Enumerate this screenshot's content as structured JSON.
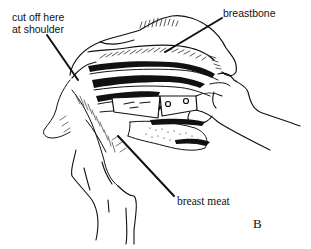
{
  "figure": {
    "panel_letter": "B",
    "labels": {
      "shoulder_line1": "cut off here",
      "shoulder_line2": "at shoulder",
      "breastbone": "breastbone",
      "breast_meat": "breast meat"
    },
    "colors": {
      "ink": "#111111",
      "paper": "#ffffff"
    },
    "icons": {
      "illustration": "poultry-carcass-with-knife-and-hands-drawing"
    }
  }
}
